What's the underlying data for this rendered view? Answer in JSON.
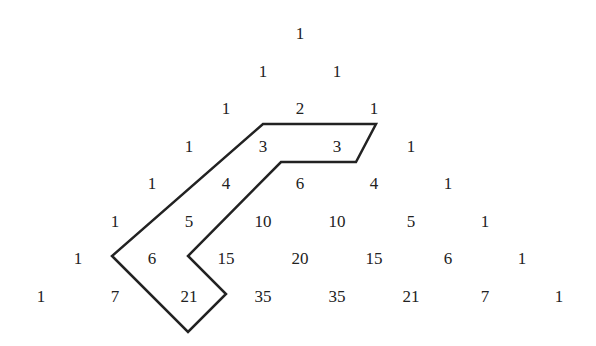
{
  "diagram": {
    "rows": [
      [
        1
      ],
      [
        1,
        1
      ],
      [
        1,
        2,
        1
      ],
      [
        1,
        3,
        3,
        1
      ],
      [
        1,
        4,
        6,
        4,
        1
      ],
      [
        1,
        5,
        10,
        10,
        5,
        1
      ],
      [
        1,
        6,
        15,
        20,
        15,
        6,
        1
      ],
      [
        1,
        7,
        21,
        35,
        35,
        21,
        7,
        1
      ]
    ],
    "layout": {
      "center_x": 300,
      "first_row_y": 33,
      "row_spacing": 37.5,
      "col_spacing": 74
    },
    "highlight": {
      "description": "Hockey-stick outline enclosing 3, 3, 4, 5, 6, 21",
      "enclosed_values": [
        3,
        3,
        4,
        5,
        6,
        21
      ],
      "stroke_color": "#222222",
      "stroke_width": 2.5,
      "points": [
        [
          263,
          124
        ],
        [
          376,
          124
        ],
        [
          356,
          162
        ],
        [
          281,
          162
        ],
        [
          188,
          256
        ],
        [
          226,
          294
        ],
        [
          188,
          332
        ],
        [
          112,
          256
        ]
      ]
    }
  }
}
